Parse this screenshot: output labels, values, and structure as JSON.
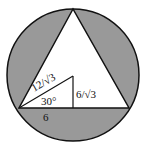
{
  "diagram": {
    "colors": {
      "shade": "#999999",
      "stroke": "#111111",
      "background": "#ffffff"
    },
    "labels": {
      "hypotenuse": "12/√3",
      "height": "6/√3",
      "angle": "30°",
      "base": "6"
    }
  }
}
